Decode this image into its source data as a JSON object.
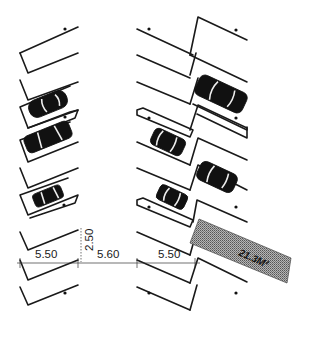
{
  "diagram": {
    "dimensions": {
      "stall_depth_left": "5.50",
      "aisle_width": "5.60",
      "stall_depth_right": "5.50",
      "stall_width": "2.50"
    },
    "area_label": "21.3M²",
    "colors": {
      "line": "#1a1a1a",
      "hatch": "#8c8c8c",
      "background": "#ffffff"
    },
    "cars": [
      {
        "side": "left",
        "label": "car-1"
      },
      {
        "side": "left",
        "label": "car-2"
      },
      {
        "side": "left",
        "label": "car-3"
      },
      {
        "side": "right",
        "label": "car-4"
      },
      {
        "side": "right",
        "label": "car-5"
      },
      {
        "side": "right",
        "label": "car-6"
      },
      {
        "side": "right",
        "label": "car-7"
      }
    ]
  }
}
